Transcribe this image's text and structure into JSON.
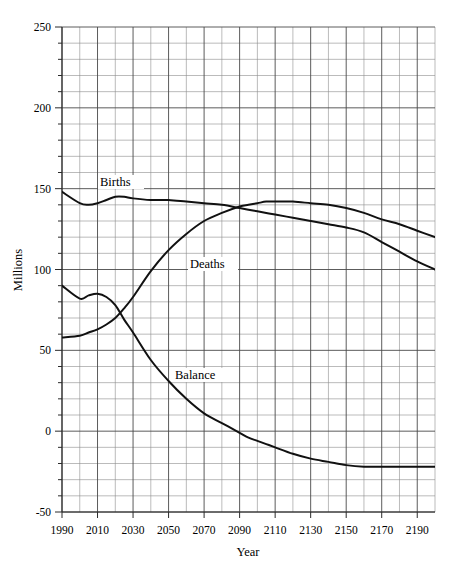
{
  "chart_data": {
    "type": "line",
    "title": "",
    "xlabel": "Year",
    "ylabel": "Millions",
    "xlim": [
      1990,
      2200
    ],
    "ylim": [
      -50,
      250
    ],
    "grid": true,
    "grid_major_x_step": 20,
    "grid_minor_x_step": 10,
    "grid_major_y_step": 50,
    "grid_minor_y_step": 10,
    "legend_position": "inline-annotations",
    "x_tick_labels": [
      "1990",
      "2010",
      "2030",
      "2050",
      "2070",
      "2090",
      "2110",
      "2130",
      "2150",
      "2170",
      "2190"
    ],
    "y_tick_labels": [
      "250",
      "200",
      "150",
      "100",
      "50",
      "0",
      "-50"
    ],
    "x": [
      1990,
      2000,
      2005,
      2010,
      2015,
      2020,
      2025,
      2030,
      2040,
      2050,
      2060,
      2070,
      2080,
      2090,
      2095,
      2100,
      2105,
      2110,
      2120,
      2130,
      2140,
      2150,
      2160,
      2170,
      2180,
      2190,
      2200
    ],
    "series": [
      {
        "name": "Births",
        "label": "Births",
        "values": [
          148,
          141,
          140,
          141,
          143,
          145,
          145,
          144,
          143,
          143,
          142,
          141,
          140,
          138,
          137,
          136,
          135,
          134,
          132,
          130,
          128,
          126,
          123,
          117,
          111,
          105,
          100
        ]
      },
      {
        "name": "Deaths",
        "label": "Deaths",
        "values": [
          58,
          59,
          61,
          63,
          66,
          70,
          76,
          83,
          99,
          112,
          122,
          130,
          135,
          139,
          140,
          141,
          142,
          142,
          142,
          141,
          140,
          138,
          135,
          131,
          128,
          124,
          120
        ]
      },
      {
        "name": "Balance",
        "label": "Balance",
        "values": [
          90,
          82,
          84,
          85,
          83,
          78,
          69,
          61,
          44,
          31,
          20,
          11,
          5,
          -1,
          -4,
          -6,
          -8,
          -10,
          -14,
          -17,
          -19,
          -21,
          -22,
          -22,
          -22,
          -22,
          -22
        ]
      }
    ]
  },
  "annotations": {
    "births": "Births",
    "deaths": "Deaths",
    "balance": "Balance"
  },
  "axes": {
    "x_title": "Year",
    "y_title": "Millions"
  }
}
